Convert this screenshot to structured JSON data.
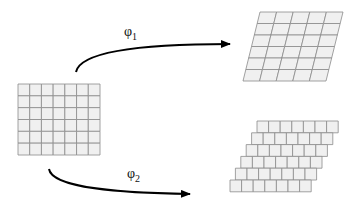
{
  "diagram": {
    "source_grid": {
      "cols": 7,
      "rows": 6,
      "x": 18,
      "y": 84,
      "w": 82,
      "h": 71
    },
    "target_top": {
      "cols": 5,
      "rows": 6,
      "top_left": [
        260,
        12
      ],
      "top_right": [
        343,
        12
      ],
      "bottom_left": [
        243,
        81
      ],
      "bottom_right": [
        326,
        81
      ]
    },
    "target_bottom": {
      "cols": 7,
      "rows": 6,
      "x": 257,
      "y": 121,
      "cell_w": 11.6,
      "row_h": 11.8,
      "row_shift": -5.4
    },
    "arrows": [
      {
        "label": "φ",
        "sub": "1"
      },
      {
        "label": "φ",
        "sub": "2"
      }
    ],
    "colors": {
      "cell_fill": "#f0f0f0",
      "grid_line": "#8a8a8a",
      "arrow": "#000000"
    }
  }
}
